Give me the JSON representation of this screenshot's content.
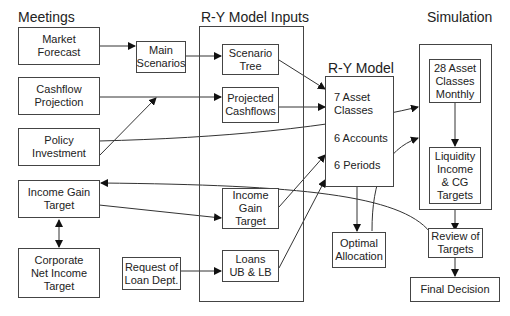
{
  "sections": {
    "meetings": "Meetings",
    "model_inputs": "R-Y Model Inputs",
    "model": "R-Y Model",
    "simulation": "Simulation"
  },
  "meetings": {
    "market_forecast": "Market\nForecast",
    "cashflow_projection": "Cashflow\nProjection",
    "policy_investment": "Policy\nInvestment",
    "income_gain_target": "Income Gain\nTarget",
    "corporate_net_income_target": "Corporate\nNet Income\nTarget"
  },
  "intermediate": {
    "main_scenarios": "Main\nScenarios",
    "request_of_loan_dept": "Request of\nLoan Dept."
  },
  "model_inputs": {
    "scenario_tree": "Scenario\nTree",
    "projected_cashflows": "Projected\nCashflows",
    "income_gain_target": "Income\nGain\nTarget",
    "loans": "Loans\nUB & LB"
  },
  "model": {
    "asset_classes": "7 Asset\nClasses",
    "accounts": "6 Accounts",
    "periods": "6 Periods"
  },
  "simulation": {
    "asset_classes_monthly": "28 Asset\nClasses\nMonthly",
    "liquidity_targets": "Liquidity\nIncome\n& CG\nTargets"
  },
  "outputs": {
    "optimal_allocation": "Optimal\nAllocation",
    "review_of_targets": "Review of\nTargets",
    "final_decision": "Final Decision"
  }
}
